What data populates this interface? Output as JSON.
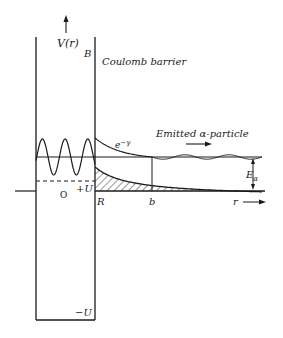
{
  "diagram": {
    "labels": {
      "y_axis": "V(r)",
      "barrier_top": "B",
      "coulomb": "Coulomb barrier",
      "tunnel": "e",
      "tunnel_exp": "−γ",
      "emitted": "Emitted α-particle",
      "origin": "O",
      "plus_u": "+U",
      "minus_u": "−U",
      "nuclear_radius": "R",
      "turning_point": "b",
      "r_axis": "r",
      "energy": "E",
      "energy_sub": "α"
    },
    "colors": {
      "ink": "#1a1a1a",
      "background": "#ffffff"
    }
  }
}
